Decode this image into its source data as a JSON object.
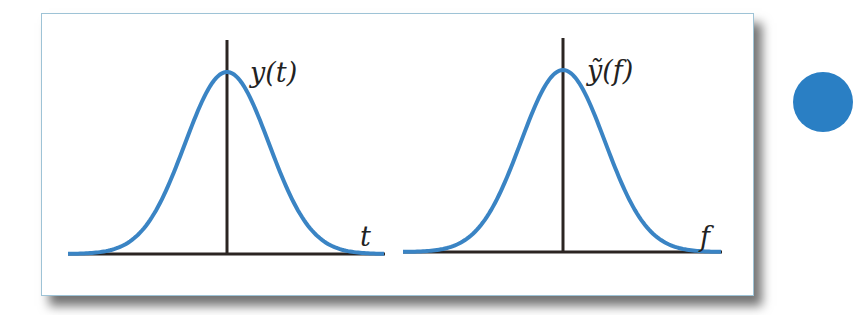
{
  "diagram": {
    "panels": [
      {
        "id": "time",
        "label": "y(t)",
        "axis_label": "t",
        "curve": "gaussian"
      },
      {
        "id": "frequency",
        "label": "ỹ(f)",
        "axis_label": "f",
        "curve": "gaussian"
      }
    ],
    "colors": {
      "curve": "#3a84c4",
      "axis": "#2b2522",
      "frame_border": "#9ec3d6",
      "side_circle": "#2a7fc4"
    }
  }
}
